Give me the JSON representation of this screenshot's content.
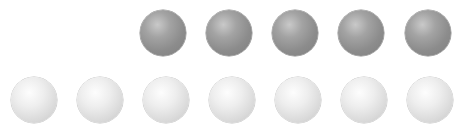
{
  "scene": {
    "description": "Two rows of shaded spheres",
    "colors": {
      "dark_sphere": "#8c8c8c",
      "light_sphere": "#e6e6e6",
      "background": "#ffffff"
    },
    "top_row": {
      "count": 5,
      "shade": "dark",
      "spheres": [
        {
          "x": 140,
          "y": 10
        },
        {
          "x": 206,
          "y": 10
        },
        {
          "x": 272,
          "y": 10
        },
        {
          "x": 338,
          "y": 10
        },
        {
          "x": 405,
          "y": 10
        }
      ]
    },
    "bottom_row": {
      "count": 7,
      "shade": "light",
      "spheres": [
        {
          "x": 11,
          "y": 77
        },
        {
          "x": 77,
          "y": 77
        },
        {
          "x": 143,
          "y": 77
        },
        {
          "x": 209,
          "y": 77
        },
        {
          "x": 275,
          "y": 77
        },
        {
          "x": 341,
          "y": 77
        },
        {
          "x": 407,
          "y": 77
        }
      ]
    }
  }
}
